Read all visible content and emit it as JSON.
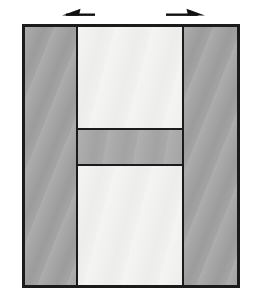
{
  "diagram": {
    "arrows": [
      {
        "name": "left-extension-arrow",
        "direction": "left"
      },
      {
        "name": "right-extension-arrow",
        "direction": "right"
      }
    ],
    "regions": [
      {
        "name": "left-side-block",
        "fill": "gray"
      },
      {
        "name": "upper-center-block",
        "fill": "light"
      },
      {
        "name": "middle-band",
        "fill": "gray"
      },
      {
        "name": "lower-center-block",
        "fill": "light"
      },
      {
        "name": "right-side-block",
        "fill": "gray"
      }
    ],
    "colors": {
      "background": "#ffffff",
      "outline": "#1b1b1b",
      "gray_block": "#a4a4a4",
      "middle_band": "#a9a9a9",
      "light_block": "#f1f1ef",
      "arrow": "#111111"
    }
  }
}
